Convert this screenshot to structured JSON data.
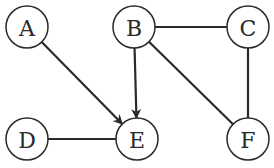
{
  "graph": {
    "nodes": [
      {
        "id": "A",
        "label": "A",
        "x": 27,
        "y": 27
      },
      {
        "id": "B",
        "label": "B",
        "x": 134,
        "y": 27
      },
      {
        "id": "C",
        "label": "C",
        "x": 248,
        "y": 27
      },
      {
        "id": "D",
        "label": "D",
        "x": 27,
        "y": 139
      },
      {
        "id": "E",
        "label": "E",
        "x": 137,
        "y": 139
      },
      {
        "id": "F",
        "label": "F",
        "x": 248,
        "y": 139
      }
    ],
    "edges": [
      {
        "from": "A",
        "to": "E",
        "directed": true
      },
      {
        "from": "B",
        "to": "E",
        "directed": true
      },
      {
        "from": "B",
        "to": "C",
        "directed": false
      },
      {
        "from": "B",
        "to": "F",
        "directed": false
      },
      {
        "from": "C",
        "to": "F",
        "directed": false
      },
      {
        "from": "D",
        "to": "E",
        "directed": false
      }
    ],
    "node_radius": 21,
    "colors": {
      "stroke": "#2a2a2a",
      "fill": "#ffffff"
    }
  }
}
